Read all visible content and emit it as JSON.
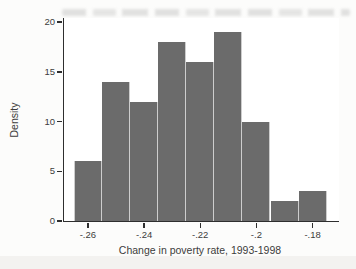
{
  "figure": {
    "page_bg": "#fcfcfb",
    "plot_bg": "#ffffff"
  },
  "chart_data": {
    "type": "bar",
    "chart_kind": "histogram",
    "title": "",
    "xlabel": "Change in poverty rate, 1993-1998",
    "ylabel": "Density",
    "bin_width": 0.01,
    "bin_centers": [
      -0.26,
      -0.25,
      -0.24,
      -0.23,
      -0.22,
      -0.21,
      -0.2,
      -0.19,
      -0.18
    ],
    "values": [
      6,
      14,
      12,
      18,
      16,
      19,
      10,
      2,
      3
    ],
    "x_ticks": [
      {
        "value": -0.26,
        "label": "-.26"
      },
      {
        "value": -0.24,
        "label": "-.24"
      },
      {
        "value": -0.22,
        "label": "-.22"
      },
      {
        "value": -0.2,
        "label": "-.2"
      },
      {
        "value": -0.18,
        "label": "-.18"
      }
    ],
    "y_ticks": [
      {
        "value": 0,
        "label": "0"
      },
      {
        "value": 5,
        "label": "5"
      },
      {
        "value": 10,
        "label": "10"
      },
      {
        "value": 15,
        "label": "15"
      },
      {
        "value": 20,
        "label": "20"
      }
    ],
    "xlim": [
      -0.2685,
      -0.1706
    ],
    "ylim": [
      0,
      20.4
    ],
    "grid": false,
    "legend": "none",
    "colors": {
      "bar_fill": "#6b6b6b",
      "bar_separator": "#cdcdcd",
      "axis": "#2e2e2e",
      "text": "#3c3c3c"
    }
  }
}
